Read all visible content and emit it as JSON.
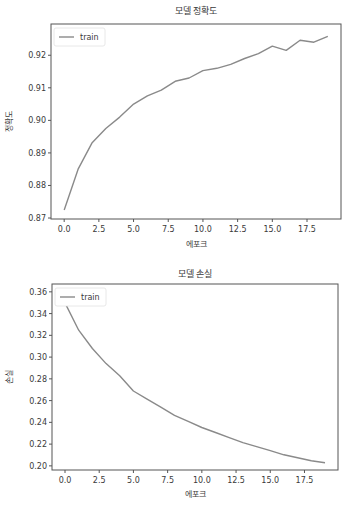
{
  "chart_data": [
    {
      "type": "line",
      "title": "모델 정확도",
      "xlabel": "에포크",
      "ylabel": "정확도",
      "x": [
        0,
        1,
        2,
        3,
        4,
        5,
        6,
        7,
        8,
        9,
        10,
        11,
        12,
        13,
        14,
        15,
        16,
        17,
        18,
        19
      ],
      "series": [
        {
          "name": "train",
          "color": "#8a8a8a",
          "values": [
            0.8725,
            0.885,
            0.893,
            0.8975,
            0.901,
            0.905,
            0.9075,
            0.9093,
            0.912,
            0.913,
            0.9153,
            0.916,
            0.9172,
            0.919,
            0.9205,
            0.9228,
            0.9215,
            0.9246,
            0.924,
            0.9258
          ]
        }
      ],
      "xlim": [
        -0.95,
        19.95
      ],
      "ylim": [
        0.8697,
        0.9296
      ],
      "xticks": [
        0.0,
        2.5,
        5.0,
        7.5,
        10.0,
        12.5,
        15.0,
        17.5
      ],
      "xtick_labels": [
        "0.0",
        "2.5",
        "5.0",
        "7.5",
        "10.0",
        "12.5",
        "15.0",
        "17.5"
      ],
      "yticks": [
        0.87,
        0.88,
        0.89,
        0.9,
        0.91,
        0.92
      ],
      "ytick_labels": [
        "0.87",
        "0.88",
        "0.89",
        "0.90",
        "0.91",
        "0.92"
      ],
      "legend": {
        "position": "upper left",
        "entries": [
          "train"
        ]
      },
      "grid": false
    },
    {
      "type": "line",
      "title": "모델 손실",
      "xlabel": "에포크",
      "ylabel": "손실",
      "x": [
        0,
        1,
        2,
        3,
        4,
        5,
        6,
        7,
        8,
        9,
        10,
        11,
        12,
        13,
        14,
        15,
        16,
        17,
        18,
        19
      ],
      "series": [
        {
          "name": "train",
          "color": "#8a8a8a",
          "values": [
            0.3498,
            0.3247,
            0.3079,
            0.294,
            0.2828,
            0.2688,
            0.2614,
            0.254,
            0.2465,
            0.2409,
            0.2353,
            0.2307,
            0.226,
            0.2214,
            0.2177,
            0.214,
            0.2102,
            0.2074,
            0.2047,
            0.2028
          ]
        }
      ],
      "xlim": [
        -0.95,
        19.95
      ],
      "ylim": [
        0.1962,
        0.3672
      ],
      "xticks": [
        0.0,
        2.5,
        5.0,
        7.5,
        10.0,
        12.5,
        15.0,
        17.5
      ],
      "xtick_labels": [
        "0.0",
        "2.5",
        "5.0",
        "7.5",
        "10.0",
        "12.5",
        "15.0",
        "17.5"
      ],
      "yticks": [
        0.2,
        0.22,
        0.24,
        0.26,
        0.28,
        0.3,
        0.32,
        0.34,
        0.36
      ],
      "ytick_labels": [
        "0.20",
        "0.22",
        "0.24",
        "0.26",
        "0.28",
        "0.30",
        "0.32",
        "0.34",
        "0.36"
      ],
      "legend": {
        "position": "upper left",
        "entries": [
          "train"
        ]
      },
      "grid": false
    }
  ],
  "layout": [
    {
      "top": 0,
      "height": 255,
      "box": {
        "x0": 51,
        "y0": 24,
        "x1": 341,
        "y1": 219
      },
      "title_y": 14,
      "ylabel_x": 12
    },
    {
      "top": 262,
      "height": 249,
      "box": {
        "x0": 52,
        "y0": 22,
        "x1": 338,
        "y1": 208
      },
      "title_y": 15,
      "ylabel_x": 12
    }
  ]
}
